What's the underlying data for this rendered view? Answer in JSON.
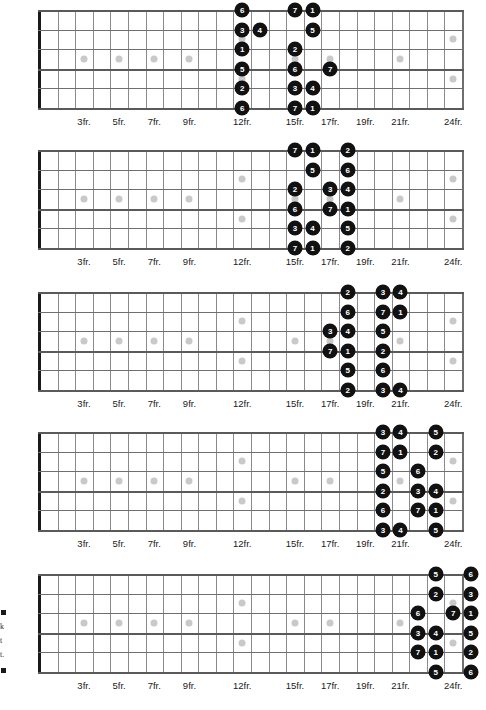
{
  "doc": {
    "title": "Guitar Scale Positions Fretboard Diagrams",
    "strings_count": 6,
    "frets_count": 24,
    "fret_labels": [
      "3fr.",
      "5fr.",
      "7fr.",
      "9fr.",
      "12fr.",
      "15fr.",
      "17fr.",
      "19fr.",
      "21fr.",
      "24fr."
    ],
    "fret_label_positions": [
      3,
      5,
      7,
      9,
      12,
      15,
      17,
      19,
      21,
      24
    ],
    "inlay_single_frets": [
      3,
      5,
      7,
      9,
      15,
      17,
      21
    ],
    "inlay_double_frets": [
      12,
      24
    ],
    "note_color": "#111111",
    "note_text_color": "#ffffff",
    "inlay_color": "#c9c9c9",
    "fret_color": "#8a8a8a",
    "nut_color": "#1a1a1a"
  },
  "margin_notes": {
    "line1": "k",
    "line2": "t",
    "line3": "t."
  },
  "chart_data": {
    "type": "table",
    "xlabel": "Fret",
    "ylabel": "String",
    "legend": "Numbers are scale degrees 1-7",
    "diagrams": [
      {
        "name": "position-1",
        "fret_range": [
          12,
          16
        ],
        "notes": [
          {
            "string": 1,
            "fret": 12,
            "degree": "6"
          },
          {
            "string": 1,
            "fret": 15,
            "degree": "7"
          },
          {
            "string": 1,
            "fret": 16,
            "degree": "1"
          },
          {
            "string": 2,
            "fret": 12,
            "degree": "3"
          },
          {
            "string": 2,
            "fret": 13,
            "degree": "4"
          },
          {
            "string": 2,
            "fret": 16,
            "degree": "5"
          },
          {
            "string": 3,
            "fret": 12,
            "degree": "1"
          },
          {
            "string": 3,
            "fret": 15,
            "degree": "2"
          },
          {
            "string": 4,
            "fret": 12,
            "degree": "5"
          },
          {
            "string": 4,
            "fret": 15,
            "degree": "6"
          },
          {
            "string": 4,
            "fret": 17,
            "degree": "7"
          },
          {
            "string": 5,
            "fret": 12,
            "degree": "2"
          },
          {
            "string": 5,
            "fret": 15,
            "degree": "3"
          },
          {
            "string": 5,
            "fret": 16,
            "degree": "4"
          },
          {
            "string": 6,
            "fret": 12,
            "degree": "6"
          },
          {
            "string": 6,
            "fret": 15,
            "degree": "7"
          },
          {
            "string": 6,
            "fret": 16,
            "degree": "1"
          }
        ]
      },
      {
        "name": "position-2",
        "fret_range": [
          14,
          18
        ],
        "notes": [
          {
            "string": 1,
            "fret": 15,
            "degree": "7"
          },
          {
            "string": 1,
            "fret": 16,
            "degree": "1"
          },
          {
            "string": 1,
            "fret": 18,
            "degree": "2"
          },
          {
            "string": 2,
            "fret": 16,
            "degree": "5"
          },
          {
            "string": 2,
            "fret": 18,
            "degree": "6"
          },
          {
            "string": 3,
            "fret": 15,
            "degree": "2"
          },
          {
            "string": 3,
            "fret": 17,
            "degree": "3"
          },
          {
            "string": 3,
            "fret": 18,
            "degree": "4"
          },
          {
            "string": 4,
            "fret": 15,
            "degree": "6"
          },
          {
            "string": 4,
            "fret": 17,
            "degree": "7"
          },
          {
            "string": 4,
            "fret": 18,
            "degree": "1"
          },
          {
            "string": 5,
            "fret": 15,
            "degree": "3"
          },
          {
            "string": 5,
            "fret": 16,
            "degree": "4"
          },
          {
            "string": 5,
            "fret": 18,
            "degree": "5"
          },
          {
            "string": 6,
            "fret": 15,
            "degree": "7"
          },
          {
            "string": 6,
            "fret": 16,
            "degree": "1"
          },
          {
            "string": 6,
            "fret": 18,
            "degree": "2"
          }
        ]
      },
      {
        "name": "position-3",
        "fret_range": [
          16,
          21
        ],
        "notes": [
          {
            "string": 1,
            "fret": 18,
            "degree": "2"
          },
          {
            "string": 1,
            "fret": 20,
            "degree": "3"
          },
          {
            "string": 1,
            "fret": 21,
            "degree": "4"
          },
          {
            "string": 2,
            "fret": 18,
            "degree": "6"
          },
          {
            "string": 2,
            "fret": 20,
            "degree": "7"
          },
          {
            "string": 2,
            "fret": 21,
            "degree": "1"
          },
          {
            "string": 3,
            "fret": 17,
            "degree": "3"
          },
          {
            "string": 3,
            "fret": 18,
            "degree": "4"
          },
          {
            "string": 3,
            "fret": 20,
            "degree": "5"
          },
          {
            "string": 4,
            "fret": 17,
            "degree": "7"
          },
          {
            "string": 4,
            "fret": 18,
            "degree": "1"
          },
          {
            "string": 4,
            "fret": 20,
            "degree": "2"
          },
          {
            "string": 5,
            "fret": 18,
            "degree": "5"
          },
          {
            "string": 5,
            "fret": 20,
            "degree": "6"
          },
          {
            "string": 6,
            "fret": 18,
            "degree": "2"
          },
          {
            "string": 6,
            "fret": 20,
            "degree": "3"
          },
          {
            "string": 6,
            "fret": 21,
            "degree": "4"
          }
        ]
      },
      {
        "name": "position-4",
        "fret_range": [
          19,
          23
        ],
        "notes": [
          {
            "string": 1,
            "fret": 20,
            "degree": "3"
          },
          {
            "string": 1,
            "fret": 21,
            "degree": "4"
          },
          {
            "string": 1,
            "fret": 23,
            "degree": "5"
          },
          {
            "string": 2,
            "fret": 20,
            "degree": "7"
          },
          {
            "string": 2,
            "fret": 21,
            "degree": "1"
          },
          {
            "string": 2,
            "fret": 23,
            "degree": "2"
          },
          {
            "string": 3,
            "fret": 20,
            "degree": "5"
          },
          {
            "string": 3,
            "fret": 22,
            "degree": "6"
          },
          {
            "string": 4,
            "fret": 20,
            "degree": "2"
          },
          {
            "string": 4,
            "fret": 22,
            "degree": "3"
          },
          {
            "string": 4,
            "fret": 23,
            "degree": "4"
          },
          {
            "string": 5,
            "fret": 20,
            "degree": "6"
          },
          {
            "string": 5,
            "fret": 22,
            "degree": "7"
          },
          {
            "string": 5,
            "fret": 23,
            "degree": "1"
          },
          {
            "string": 6,
            "fret": 20,
            "degree": "3"
          },
          {
            "string": 6,
            "fret": 21,
            "degree": "4"
          },
          {
            "string": 6,
            "fret": 23,
            "degree": "5"
          }
        ]
      },
      {
        "name": "position-5",
        "fret_range": [
          21,
          24
        ],
        "notes": [
          {
            "string": 1,
            "fret": 23,
            "degree": "5"
          },
          {
            "string": 1,
            "fret": 25,
            "degree": "6"
          },
          {
            "string": 2,
            "fret": 23,
            "degree": "2"
          },
          {
            "string": 2,
            "fret": 25,
            "degree": "3"
          },
          {
            "string": 3,
            "fret": 22,
            "degree": "6"
          },
          {
            "string": 3,
            "fret": 24,
            "degree": "7"
          },
          {
            "string": 3,
            "fret": 25,
            "degree": "1"
          },
          {
            "string": 4,
            "fret": 22,
            "degree": "3"
          },
          {
            "string": 4,
            "fret": 23,
            "degree": "4"
          },
          {
            "string": 4,
            "fret": 25,
            "degree": "5"
          },
          {
            "string": 5,
            "fret": 22,
            "degree": "7"
          },
          {
            "string": 5,
            "fret": 23,
            "degree": "1"
          },
          {
            "string": 5,
            "fret": 25,
            "degree": "2"
          },
          {
            "string": 6,
            "fret": 23,
            "degree": "5"
          },
          {
            "string": 6,
            "fret": 25,
            "degree": "6"
          }
        ]
      }
    ]
  }
}
